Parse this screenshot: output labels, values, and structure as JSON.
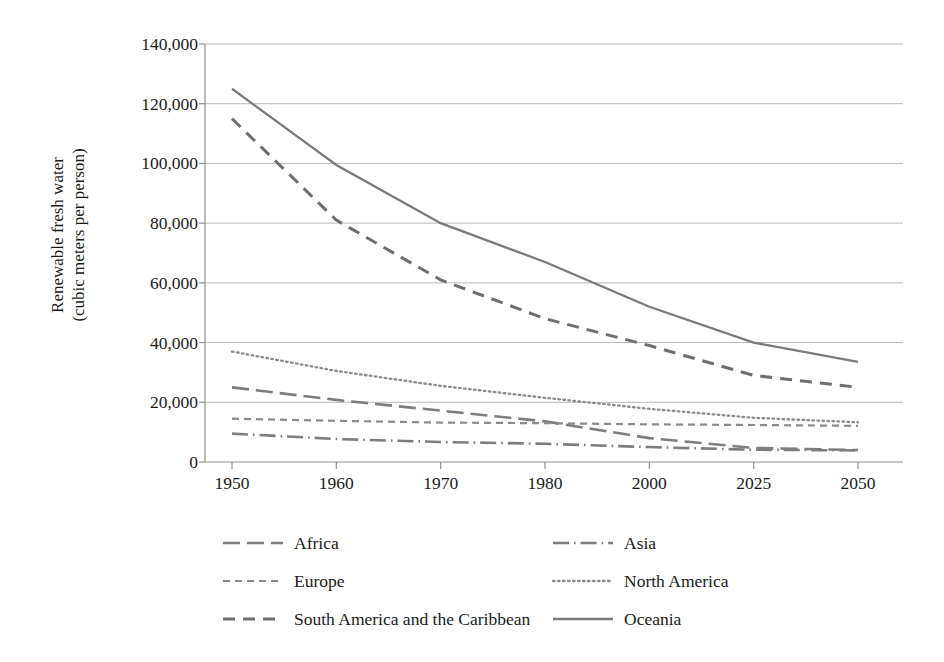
{
  "chart_data": {
    "type": "line",
    "title": "",
    "xlabel": "",
    "ylabel_line1": "Renewable fresh water",
    "ylabel_line2": "(cubic meters per person)",
    "categories": [
      "1950",
      "1960",
      "1970",
      "1980",
      "2000",
      "2025",
      "2050"
    ],
    "ylim": [
      0,
      140000
    ],
    "ytick_labels": [
      "140,000",
      "120,000",
      "100,000",
      "80,000",
      "60,000",
      "40,000",
      "20,000",
      "0"
    ],
    "ytick_values": [
      140000,
      120000,
      100000,
      80000,
      60000,
      40000,
      20000,
      0
    ],
    "grid": true,
    "legend_position": "bottom",
    "series": [
      {
        "name": "Africa",
        "dash": "long-dash",
        "color": "#7d7d7d",
        "values": [
          25000,
          20800,
          17200,
          13600,
          8000,
          4700,
          4000
        ]
      },
      {
        "name": "Asia",
        "dash": "dash-dot",
        "color": "#7d7d7d",
        "values": [
          9500,
          7700,
          6700,
          6100,
          5000,
          4100,
          3900
        ]
      },
      {
        "name": "Europe",
        "dash": "short-dash",
        "color": "#8a8a8a",
        "values": [
          14500,
          13800,
          13200,
          13000,
          12600,
          12400,
          12100
        ]
      },
      {
        "name": "North America",
        "dash": "dotted",
        "color": "#8a8a8a",
        "values": [
          37000,
          30500,
          25500,
          21500,
          17800,
          14800,
          13300
        ]
      },
      {
        "name": "South America and the Caribbean",
        "dash": "medium-dash",
        "color": "#6e6e6e",
        "values": [
          115000,
          81000,
          61000,
          48000,
          39000,
          29000,
          25000
        ]
      },
      {
        "name": "Oceania",
        "dash": "solid",
        "color": "#7a7a7a",
        "values": [
          125000,
          99500,
          80000,
          67000,
          52000,
          40000,
          33500
        ]
      }
    ]
  },
  "legend": {
    "items": [
      {
        "label": "Africa"
      },
      {
        "label": "Asia"
      },
      {
        "label": "Europe"
      },
      {
        "label": "North America"
      },
      {
        "label": "South America and the Caribbean"
      },
      {
        "label": "Oceania"
      }
    ]
  }
}
